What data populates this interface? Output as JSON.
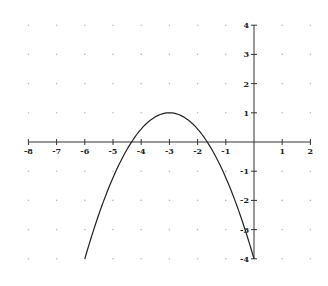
{
  "chart_data": {
    "type": "line",
    "title": "",
    "xlabel": "",
    "ylabel": "",
    "xlim": [
      -8,
      2
    ],
    "ylim": [
      -4,
      4
    ],
    "grid": "dots at integer points",
    "x_ticks": [
      -8,
      -7,
      -6,
      -5,
      -4,
      -3,
      -2,
      -1,
      1,
      2
    ],
    "y_ticks": [
      4,
      3,
      2,
      1,
      -1,
      -2,
      -3,
      -4
    ],
    "series": [
      {
        "name": "parabola",
        "equation": "y = -5/9 (x + 3)^2 + 1",
        "vertex": [
          -3,
          1
        ],
        "x_range": [
          -6,
          0
        ],
        "x": [
          -6,
          -5.5,
          -5,
          -4.5,
          -4,
          -3.5,
          -3,
          -2.5,
          -2,
          -1.5,
          -1,
          -0.5,
          0
        ],
        "values": [
          -4,
          -2.47,
          -1.22,
          -0.25,
          0.44,
          0.86,
          1,
          0.86,
          0.44,
          -0.25,
          -1.22,
          -2.47,
          -4
        ],
        "color": "#222222"
      }
    ],
    "x_intercepts": [
      -4.34,
      -1.66
    ]
  }
}
